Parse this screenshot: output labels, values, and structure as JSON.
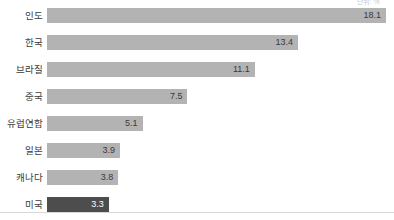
{
  "chart_data": {
    "type": "bar",
    "orientation": "horizontal",
    "title": "",
    "subtitle": "",
    "xlabel": "",
    "ylabel": "",
    "unit_note": "단위: %",
    "categories": [
      "인도",
      "한국",
      "브라질",
      "중국",
      "유럽연합",
      "일본",
      "캐나다",
      "미국"
    ],
    "values": [
      18.1,
      13.4,
      11.1,
      7.5,
      5.1,
      3.9,
      3.8,
      3.3
    ],
    "value_labels": [
      "18.1",
      "13.4",
      "11.1",
      "7.5",
      "5.1",
      "3.9",
      "3.8",
      "3.3"
    ],
    "xlim": [
      0,
      18.1
    ],
    "grid": false,
    "legend": false,
    "colors": {
      "bar": "#b3b3b3",
      "bar_highlight": "#4d4d4d",
      "label_text": "#3a3a3a",
      "highlight_label_text": "#ffffff",
      "baseline": "#d8d8d8",
      "background": "#ffffff"
    },
    "highlight_index": 7,
    "bars": [
      {
        "category": "인도",
        "value": 18.1,
        "label": "18.1",
        "highlight": false
      },
      {
        "category": "한국",
        "value": 13.4,
        "label": "13.4",
        "highlight": false
      },
      {
        "category": "브라질",
        "value": 11.1,
        "label": "11.1",
        "highlight": false
      },
      {
        "category": "중국",
        "value": 7.5,
        "label": "7.5",
        "highlight": false
      },
      {
        "category": "유럽연합",
        "value": 5.1,
        "label": "5.1",
        "highlight": false
      },
      {
        "category": "일본",
        "value": 3.9,
        "label": "3.9",
        "highlight": false
      },
      {
        "category": "캐나다",
        "value": 3.8,
        "label": "3.8",
        "highlight": false
      },
      {
        "category": "미국",
        "value": 3.3,
        "label": "3.3",
        "highlight": true
      }
    ]
  }
}
